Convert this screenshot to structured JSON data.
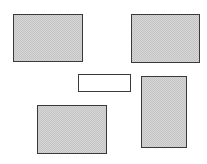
{
  "diagram": {
    "colors": {
      "background": "#ffffff",
      "border": "#3a3a3a",
      "shaded_fill": "#d6d6d6",
      "plain_fill": "#ffffff"
    },
    "boxes": [
      {
        "id": "top-left",
        "fill": "shaded",
        "x": 13,
        "y": 14,
        "w": 70,
        "h": 48
      },
      {
        "id": "top-right",
        "fill": "shaded",
        "x": 131,
        "y": 14,
        "w": 69,
        "h": 49
      },
      {
        "id": "center",
        "fill": "plain",
        "x": 78,
        "y": 74,
        "w": 53,
        "h": 18
      },
      {
        "id": "right-tall",
        "fill": "shaded",
        "x": 141,
        "y": 76,
        "w": 46,
        "h": 72
      },
      {
        "id": "bottom-left",
        "fill": "shaded",
        "x": 37,
        "y": 105,
        "w": 70,
        "h": 49
      }
    ]
  }
}
